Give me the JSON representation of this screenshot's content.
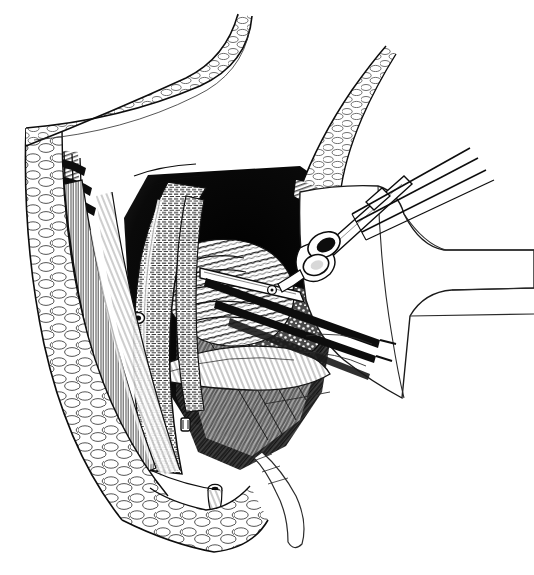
{
  "document": {
    "kind": "surgical-illustration",
    "technique": "pen-and-ink line engraving / stipple-and-hatch",
    "title": "Retroperitoneal exposure of the iliac vessels",
    "orientation": "patient right, operator view from above",
    "palette": {
      "ink": "#111111",
      "ink_soft": "#3a3a3a",
      "paper": "#ffffff",
      "shadow_deep": "#1a1a1a",
      "mid_tone": "#6e6e6e",
      "light_tone": "#bdbdbd"
    },
    "canvas": {
      "width": 534,
      "height": 575,
      "background": "#ffffff"
    }
  },
  "regions": [
    {
      "id": "skin-fat-flap-superior",
      "label": "Superior skin and subcutaneous fat flap",
      "description": "Retracted flap sweeping from upper-left to the midline apex, drawn as lobulated adipose cells",
      "texture": "fat-lobules",
      "position": "top-left arc"
    },
    {
      "id": "skin-fat-flap-lateral",
      "label": "Lateral skin and subcutaneous fat flap",
      "description": "Left lateral wound edge with full-thickness fat lobules and cut dermal margin",
      "texture": "fat-lobules",
      "position": "left border, vertical"
    },
    {
      "id": "skin-fat-flap-right",
      "label": "Right superior fat flap",
      "description": "Smaller wedge of retracted fat on the upper-right, apex pointing up",
      "texture": "fat-lobules",
      "position": "upper-right wedge"
    },
    {
      "id": "skin-fat-flap-inferior",
      "label": "Inferior wound margin",
      "description": "Lower wound corner of fat lobules meeting at an acute angle",
      "texture": "fat-lobules",
      "position": "bottom-center"
    },
    {
      "id": "fascial-layers",
      "label": "Cut fascial and aponeurotic layers",
      "description": "Concentric stepped bands along the left wound edge showing successive layers incised",
      "texture": "parallel-hatching",
      "position": "left inner margin"
    },
    {
      "id": "muscle-belly-oblique",
      "label": "Oblique muscle belly",
      "description": "Longitudinally striated muscle running inferomedially beside the wound edge",
      "texture": "fine-striation",
      "position": "left-center vertical band"
    },
    {
      "id": "muscle-belly-psoas",
      "label": "Posterior muscle floor",
      "description": "Deep muscular floor with coarse diagonal striation forming the base of the exposure",
      "texture": "diagonal-striation",
      "position": "lower-center"
    },
    {
      "id": "great-vessel",
      "label": "Great vessel (iliac / aortic segment)",
      "description": "Broad tubular structure curving from upper-center down to the lower wound, finely cross-hatched with a highlight ridge",
      "texture": "tubular-crosshatch",
      "position": "center-left, vertical curve"
    },
    {
      "id": "vessel-branch-stump",
      "label": "Ligated branch stump",
      "description": "Small cut vessel orifice on the face of the great vessel",
      "texture": "ring-lumen",
      "position": "center-left"
    },
    {
      "id": "vessel-stump-clip",
      "label": "Clipped vessel stump",
      "description": "Short clipped stump standing away from the muscular floor",
      "texture": "ring-lumen",
      "position": "lower-center-left"
    },
    {
      "id": "vessel-stump-inferior",
      "label": "Inferior cut vessel stump",
      "description": "Transected vessel end at the inferior wound angle with ribbed wall",
      "texture": "ring-lumen",
      "position": "bottom-center"
    },
    {
      "id": "bowel-loops",
      "label": "Bowel loops with mucosal folds",
      "description": "Cluster of transversely ridged bowel held to the upper-left of the cavity",
      "texture": "transverse-folds",
      "position": "center"
    },
    {
      "id": "nodal-fatty-packet",
      "label": "Lymph-node-bearing fatty packet",
      "description": "Stippled, granular mass of fat and nodes lying deep in the cavity",
      "texture": "stipple-granular",
      "position": "center-right of cavity"
    },
    {
      "id": "deep-shadow",
      "label": "Deep cavity shadow",
      "description": "Solid black field of the retroperitoneal recess behind the retracted structures",
      "texture": "solid-black",
      "position": "upper-center of cavity"
    },
    {
      "id": "peritoneal-reflection",
      "label": "Peritoneal / fascial reflection",
      "description": "Pale ribbon-like sheet sweeping across the lower cavity",
      "texture": "thin-striation",
      "position": "lower-center band"
    },
    {
      "id": "drape-right",
      "label": "Surgical drape",
      "description": "Folded sterile drape forming the large white field on the right with stepped fold lines",
      "texture": "plain-outline",
      "position": "right third"
    },
    {
      "id": "retractor-blade",
      "label": "Retracted tissue tongue",
      "description": "Narrow tapering tongue of tissue drawn out beyond the inferior wound angle",
      "texture": "plain-outline",
      "position": "bottom-right of wound"
    }
  ],
  "instruments": [
    {
      "id": "ring-handle-clamp",
      "label": "Ring-handled clamp",
      "type": "hemostatic forceps",
      "description": "Clamp with paired finger rings and a ratchet box-lock, jaws entering the cavity from the right",
      "features": [
        "finger-rings",
        "box-lock",
        "shank",
        "jaws"
      ],
      "position": "center-right"
    },
    {
      "id": "upper-forceps",
      "label": "Upper dissecting forceps",
      "type": "dissecting forceps",
      "description": "Slim double-shafted forceps entering from the upper right corner toward the wound apex",
      "features": [
        "twin-shafts",
        "fine-tip"
      ],
      "position": "upper-right diagonal"
    },
    {
      "id": "lower-forceps",
      "label": "Lower forceps / clamp shafts",
      "type": "long forceps",
      "description": "Pair of heavy dark shafts leaving the cavity toward the lower right",
      "features": [
        "twin-shafts",
        "solid-black-fill"
      ],
      "position": "right-center diagonal"
    },
    {
      "id": "jaw-on-bowel",
      "label": "Clamp jaw on bowel",
      "type": "clamp jaw",
      "description": "Long slender jaw laid across the bowel loops with a visible hinge pin",
      "features": [
        "hinge-pin",
        "long-jaw"
      ],
      "position": "center"
    }
  ],
  "textures": {
    "fat-lobules": "irregular rounded cells outlined in fine ink",
    "parallel-hatching": "tight parallel lines following layer contour",
    "fine-striation": "dense parallel muscle fibre lines",
    "tubular-crosshatch": "short transverse dashes wrapping a cylinder",
    "stipple-granular": "dense irregular dots and short strokes",
    "transverse-folds": "stacked crescent ridges",
    "solid-black": "saturated ink fill",
    "ring-lumen": "small ellipse with dark centre"
  },
  "caption": {
    "visible": false,
    "text": ""
  }
}
